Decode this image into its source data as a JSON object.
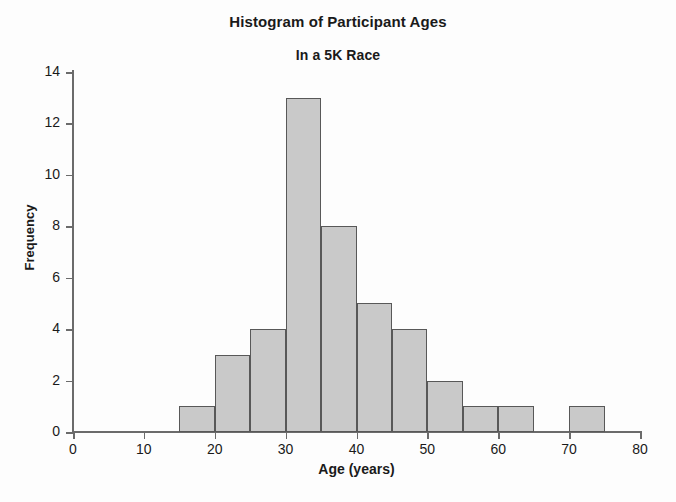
{
  "chart_data": {
    "type": "bar",
    "title": "Histogram of Participant Ages",
    "subtitle": "In a 5K Race",
    "xlabel": "Age (years)",
    "ylabel": "Frequency",
    "xlim": [
      0,
      80
    ],
    "ylim": [
      0,
      14
    ],
    "bin_width": 5,
    "grid": false,
    "legend": null,
    "x_ticks": [
      0,
      10,
      20,
      30,
      40,
      50,
      60,
      70,
      80
    ],
    "y_ticks": [
      0,
      2,
      4,
      6,
      8,
      10,
      12,
      14
    ],
    "bin_edges": [
      15,
      20,
      25,
      30,
      35,
      40,
      45,
      50,
      55,
      60,
      65,
      70,
      75
    ],
    "categories": [
      "15-20",
      "20-25",
      "25-30",
      "30-35",
      "35-40",
      "40-45",
      "45-50",
      "50-55",
      "55-60",
      "60-65",
      "65-70",
      "70-75"
    ],
    "values": [
      1,
      3,
      4,
      13,
      8,
      5,
      4,
      2,
      1,
      1,
      0,
      1
    ],
    "bars": [
      {
        "start": 15,
        "end": 20,
        "value": 1
      },
      {
        "start": 20,
        "end": 25,
        "value": 3
      },
      {
        "start": 25,
        "end": 30,
        "value": 4
      },
      {
        "start": 30,
        "end": 35,
        "value": 13
      },
      {
        "start": 35,
        "end": 40,
        "value": 8
      },
      {
        "start": 40,
        "end": 45,
        "value": 5
      },
      {
        "start": 45,
        "end": 50,
        "value": 4
      },
      {
        "start": 50,
        "end": 55,
        "value": 2
      },
      {
        "start": 55,
        "end": 60,
        "value": 1
      },
      {
        "start": 60,
        "end": 65,
        "value": 1
      },
      {
        "start": 70,
        "end": 75,
        "value": 1
      }
    ],
    "colors": {
      "bar_fill": "#c9c9c9",
      "bar_border": "#585858",
      "axis": "#6b6b6b",
      "text": "#1a1a1a",
      "background": "#fdfdfd"
    }
  }
}
